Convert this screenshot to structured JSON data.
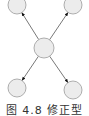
{
  "diagram": {
    "type": "star-topology",
    "colors": {
      "node_fill": "#ececec",
      "node_stroke": "#9a9a9a",
      "edge": "#555555",
      "arrowhead": "#111111"
    },
    "nodes": [
      {
        "id": "top-left",
        "label": "",
        "cx": 17,
        "cy": 5,
        "r": 9
      },
      {
        "id": "top-right",
        "label": "",
        "cx": 73,
        "cy": 5,
        "r": 9
      },
      {
        "id": "center",
        "label": "",
        "cx": 44,
        "cy": 48,
        "r": 10
      },
      {
        "id": "bottom-left",
        "label": "",
        "cx": 17,
        "cy": 88,
        "r": 9
      },
      {
        "id": "bottom-right",
        "label": "",
        "cx": 73,
        "cy": 90,
        "r": 9
      }
    ],
    "edges": [
      {
        "from": "center",
        "to": "top-left",
        "directed": true
      },
      {
        "from": "center",
        "to": "top-right",
        "directed": true
      },
      {
        "from": "center",
        "to": "bottom-left",
        "directed": true
      },
      {
        "from": "center",
        "to": "bottom-right",
        "directed": true
      }
    ]
  },
  "caption": {
    "text": "图 4.8  修正型"
  }
}
